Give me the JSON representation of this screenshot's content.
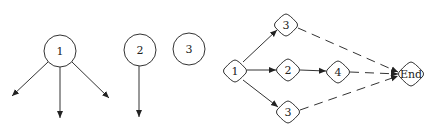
{
  "left_diagram": {
    "nodes": [
      {
        "id": "c1",
        "label": "1",
        "x": 60,
        "y": 51,
        "r": 16
      },
      {
        "id": "c2",
        "label": "2",
        "x": 140,
        "y": 50,
        "r": 16
      },
      {
        "id": "c3",
        "label": "3",
        "x": 189,
        "y": 49,
        "r": 16
      }
    ],
    "arrows": [
      {
        "from": "c1",
        "to_x": 12,
        "to_y": 96
      },
      {
        "from": "c1",
        "to_x": 59,
        "to_y": 118
      },
      {
        "from": "c1",
        "to_x": 109,
        "to_y": 98
      },
      {
        "from": "c2",
        "to_x": 139,
        "to_y": 117
      }
    ]
  },
  "right_diagram": {
    "nodes": [
      {
        "id": "n1",
        "label": "1",
        "x": 235,
        "y": 71
      },
      {
        "id": "n3a",
        "label": "3",
        "x": 286,
        "y": 25
      },
      {
        "id": "n2",
        "label": "2",
        "x": 288,
        "y": 70
      },
      {
        "id": "n4",
        "label": "4",
        "x": 338,
        "y": 72
      },
      {
        "id": "n3b",
        "label": "3",
        "x": 288,
        "y": 112
      },
      {
        "id": "end",
        "label": "End",
        "x": 411,
        "y": 74
      }
    ],
    "edges": [
      {
        "from": "n1",
        "to": "n3a",
        "style": "solid"
      },
      {
        "from": "n1",
        "to": "n2",
        "style": "solid"
      },
      {
        "from": "n1",
        "to": "n3b",
        "style": "solid"
      },
      {
        "from": "n2",
        "to": "n4",
        "style": "solid"
      },
      {
        "from": "n3a",
        "to": "end",
        "style": "dashed"
      },
      {
        "from": "n4",
        "to": "end",
        "style": "dashed"
      },
      {
        "from": "n3b",
        "to": "end",
        "style": "dashed"
      }
    ]
  }
}
